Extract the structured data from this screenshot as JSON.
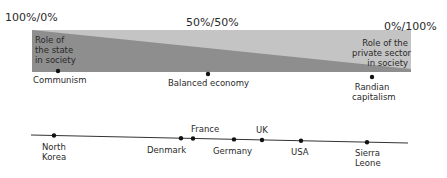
{
  "scale": {
    "left_label": "100%/0%",
    "center_label": "50%/50%",
    "right_label": "0%/100%"
  },
  "band": {
    "state_label": "Role of the state in society",
    "state_lines": [
      "Role of",
      "the state",
      "in society"
    ],
    "private_label": "Role of the private sector in society",
    "private_lines": [
      "Role of the",
      "private sector",
      "in society"
    ],
    "colors": {
      "state": "#8e8e8e",
      "private": "#c4c4c4"
    }
  },
  "spectrum_points": [
    {
      "label": "Communism",
      "lines": [
        "Communism"
      ]
    },
    {
      "label": "Balanced economy",
      "lines": [
        "Balanced economy"
      ]
    },
    {
      "label": "Randian capitalism",
      "lines": [
        "Randian",
        "capitalism"
      ]
    }
  ],
  "countries": [
    {
      "label": "North Korea",
      "lines": [
        "North",
        "Korea"
      ],
      "position": "below"
    },
    {
      "label": "Denmark",
      "lines": [
        "Denmark"
      ],
      "position": "below"
    },
    {
      "label": "France",
      "lines": [
        "France"
      ],
      "position": "above"
    },
    {
      "label": "Germany",
      "lines": [
        "Germany"
      ],
      "position": "below"
    },
    {
      "label": "UK",
      "lines": [
        "UK"
      ],
      "position": "above"
    },
    {
      "label": "USA",
      "lines": [
        "USA"
      ],
      "position": "below"
    },
    {
      "label": "Sierra Leone",
      "lines": [
        "Sierra",
        "Leone"
      ],
      "position": "below"
    }
  ]
}
